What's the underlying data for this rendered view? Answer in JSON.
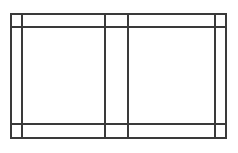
{
  "figure": {
    "name": "badminton-court-diagram",
    "type": "line-diagram",
    "width": 238,
    "height": 153,
    "background_color": "#ffffff",
    "line_color": "#3a3a3a",
    "line_color_secondary": "#4a4a4a",
    "line_width_outer": 2.2,
    "line_width_inner": 2.2
  },
  "diagram_data": {
    "type": "court-plan",
    "orientation": "landscape",
    "view": "top-down",
    "bounds": {
      "left": 11,
      "top": 14,
      "right": 226,
      "bottom": 138
    },
    "lines": [
      {
        "id": "outer-boundary-top",
        "name": "doubles-back-boundary-top",
        "orientation": "horizontal",
        "x1": 11,
        "y1": 14,
        "x2": 226,
        "y2": 14,
        "weight": 2.2
      },
      {
        "id": "outer-boundary-bottom",
        "name": "doubles-back-boundary-bottom",
        "orientation": "horizontal",
        "x1": 11,
        "y1": 138,
        "x2": 226,
        "y2": 138,
        "weight": 2.2
      },
      {
        "id": "outer-boundary-left",
        "name": "doubles-sideline-left",
        "orientation": "vertical",
        "x1": 11,
        "y1": 14,
        "x2": 11,
        "y2": 138,
        "weight": 2.2
      },
      {
        "id": "outer-boundary-right",
        "name": "doubles-sideline-right",
        "orientation": "vertical",
        "x1": 226,
        "y1": 14,
        "x2": 226,
        "y2": 138,
        "weight": 2.2
      },
      {
        "id": "long-service-line-top",
        "name": "long-service-line-top",
        "orientation": "horizontal",
        "x1": 11,
        "y1": 27,
        "x2": 226,
        "y2": 27,
        "weight": 2.4
      },
      {
        "id": "long-service-line-bottom",
        "name": "long-service-line-bottom",
        "orientation": "horizontal",
        "x1": 11,
        "y1": 124,
        "x2": 226,
        "y2": 124,
        "weight": 2.4
      },
      {
        "id": "singles-sideline-left",
        "name": "singles-sideline-left",
        "orientation": "vertical",
        "x1": 22,
        "y1": 14,
        "x2": 22,
        "y2": 138,
        "weight": 2.4
      },
      {
        "id": "singles-sideline-right",
        "name": "singles-sideline-right",
        "orientation": "vertical",
        "x1": 215,
        "y1": 14,
        "x2": 215,
        "y2": 138,
        "weight": 2.4
      },
      {
        "id": "short-service-line-left",
        "name": "short-service-line-left",
        "orientation": "vertical",
        "x1": 105,
        "y1": 14,
        "x2": 105,
        "y2": 138,
        "weight": 2.4
      },
      {
        "id": "short-service-line-right",
        "name": "short-service-line-right",
        "orientation": "vertical",
        "x1": 128,
        "y1": 14,
        "x2": 128,
        "y2": 138,
        "weight": 2.4
      }
    ],
    "regions": [
      {
        "id": "left-service-court",
        "name": "left-half-court",
        "x": 22,
        "y": 27,
        "width": 83,
        "height": 97
      },
      {
        "id": "net-corridor",
        "name": "net-corridor",
        "x": 105,
        "y": 27,
        "width": 23,
        "height": 97
      },
      {
        "id": "right-service-court",
        "name": "right-half-court",
        "x": 128,
        "y": 27,
        "width": 87,
        "height": 97
      }
    ],
    "labels": [],
    "annotations": []
  }
}
